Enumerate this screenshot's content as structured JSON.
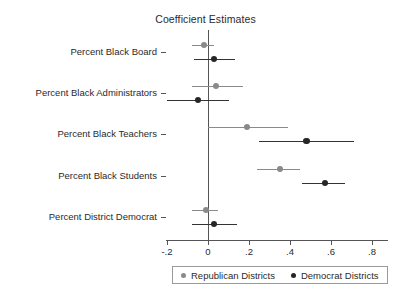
{
  "chart_data": {
    "type": "scatter",
    "title": "Coefficient Estimates",
    "xlabel": "",
    "ylabel": "",
    "xlim": [
      -0.27,
      0.81
    ],
    "grid": false,
    "legend_position": "bottom",
    "xticks": [
      -0.2,
      0,
      0.2,
      0.4,
      0.6,
      0.8
    ],
    "xticklabels": [
      "-.2",
      "0",
      ".2",
      ".4",
      ".6",
      ".8"
    ],
    "categories": [
      "Percent Black Board",
      "Percent Black Administrators",
      "Percent Black Teachers",
      "Percent Black Students",
      "Percent District Democrat"
    ],
    "reference_line": 0,
    "series": [
      {
        "name": "Republican Districts",
        "color": "#8a8a8a",
        "values": [
          -0.02,
          0.04,
          0.19,
          0.35,
          -0.01
        ],
        "ci_low": [
          -0.08,
          -0.08,
          0.0,
          0.24,
          -0.08
        ],
        "ci_high": [
          0.03,
          0.17,
          0.39,
          0.45,
          0.05
        ]
      },
      {
        "name": "Democrat Districts",
        "color": "#262626",
        "values": [
          0.03,
          -0.05,
          0.48,
          0.57,
          0.03
        ],
        "ci_low": [
          -0.07,
          -0.2,
          0.25,
          0.46,
          -0.08
        ],
        "ci_high": [
          0.13,
          0.1,
          0.71,
          0.67,
          0.14
        ]
      }
    ]
  },
  "legend": {
    "items": [
      {
        "label": "Republican Districts",
        "marker": "gray-dot"
      },
      {
        "label": "Democrat Districts",
        "marker": "black-dot"
      }
    ]
  }
}
